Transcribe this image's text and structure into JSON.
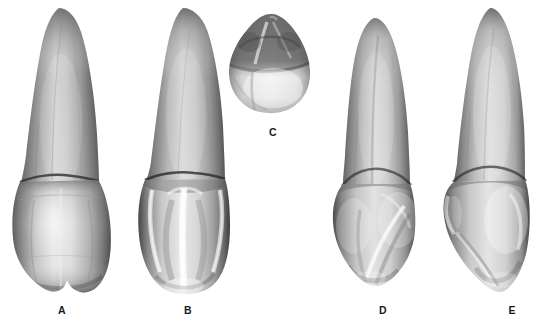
{
  "figure": {
    "background_color": "#ffffff",
    "ink_color": "#1b1b1b",
    "rendering": "grayscale photographic plate",
    "specimen_count": 5
  },
  "specimens": [
    {
      "id": "A",
      "label": "A",
      "view": "labial (facial) view",
      "label_x": 52,
      "label_y": 304,
      "tooth_x": 4,
      "tooth_y": 4,
      "tooth_w": 118,
      "tooth_h": 292
    },
    {
      "id": "B",
      "label": "B",
      "view": "lingual (palatal) view",
      "label_x": 178,
      "label_y": 304,
      "tooth_x": 134,
      "tooth_y": 4,
      "tooth_w": 104,
      "tooth_h": 292
    },
    {
      "id": "C",
      "label": "C",
      "view": "incisal view",
      "label_x": 263,
      "label_y": 126,
      "tooth_x": 225,
      "tooth_y": 12,
      "tooth_w": 88,
      "tooth_h": 104
    },
    {
      "id": "D",
      "label": "D",
      "view": "mesial view",
      "label_x": 373,
      "label_y": 304,
      "tooth_x": 330,
      "tooth_y": 14,
      "tooth_w": 100,
      "tooth_h": 280
    },
    {
      "id": "E",
      "label": "E",
      "view": "distal view",
      "label_x": 502,
      "label_y": 304,
      "tooth_x": 440,
      "tooth_y": 4,
      "tooth_w": 104,
      "tooth_h": 292
    }
  ]
}
